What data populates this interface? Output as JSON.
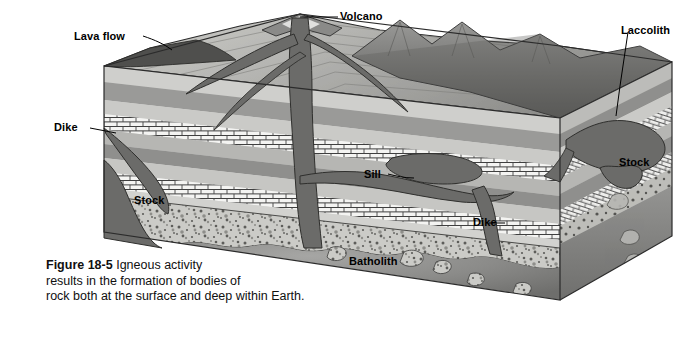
{
  "figure": {
    "number_label": "Figure 18-5",
    "caption_text": "Igneous activity results in the formation of bodies of rock both at the surface and deep within Earth.",
    "caption_line_1": "Igneous activity",
    "caption_line_2": "results in the formation of bodies of",
    "caption_line_3": "rock both at the surface and deep within Earth."
  },
  "labels": {
    "lava_flow": "Lava flow",
    "volcano": "Volcano",
    "laccolith": "Laccolith",
    "dike_left": "Dike",
    "dike_right": "Dike",
    "stock_left": "Stock",
    "stock_right": "Stock",
    "sill": "Sill",
    "batholith": "Batholith"
  },
  "colors": {
    "background": "#ffffff",
    "magma_dark": "#6b6b6b",
    "magma_darker": "#5a5a5a",
    "batholith": "#8f8f8f",
    "stratum_light": "#d8d8d6",
    "stratum_mid": "#b9b9b7",
    "stratum_dark": "#9a9a98",
    "limestone_white": "#f4f4f2",
    "limestone_line": "#4a4a4a",
    "conglomerate": "#c9c9c5",
    "mountain": "#7d7d7d",
    "outline": "#2b2b2b",
    "label_text": "#000000",
    "caption_text": "#101010"
  },
  "diagram": {
    "type": "geologic-block-diagram",
    "title_subject": "Igneous activity",
    "features": [
      "Lava flow",
      "Volcano",
      "Laccolith",
      "Dike",
      "Stock",
      "Sill",
      "Batholith"
    ],
    "strata_sequence": [
      "surface soil / lava crust",
      "light sedimentary bed",
      "dark sedimentary bed",
      "light sedimentary bed",
      "limestone brick bed",
      "dark sedimentary bed",
      "light sedimentary bed",
      "limestone brick bed",
      "conglomerate bed",
      "batholith granite"
    ]
  }
}
